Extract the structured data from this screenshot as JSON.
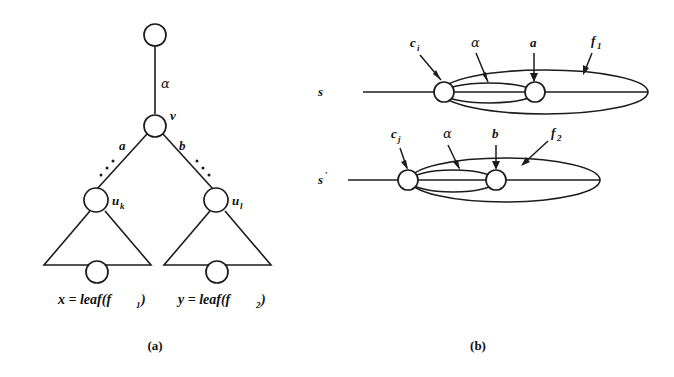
{
  "figure": {
    "background_color": "#ffffff",
    "ink_color": "#1c1c1c",
    "panels": [
      {
        "id": "panel-a",
        "caption": "(a)",
        "description": "tree diagram",
        "labels": {
          "alpha_edge": "α",
          "node_v": "v",
          "edge_a": "a",
          "edge_b": "b",
          "node_uk": "u",
          "node_uk_sub": "k",
          "node_ul": "u",
          "node_ul_sub": "l",
          "leaf_left": "x = leaf(f",
          "leaf_left_sub": "1",
          "leaf_left_end": ")",
          "leaf_right": "y = leaf(f",
          "leaf_right_sub": "2",
          "leaf_right_end": ")"
        }
      },
      {
        "id": "panel-b",
        "caption": "(b)",
        "description": "two sequence rows with nested ellipses",
        "rows": [
          {
            "id": "row-s",
            "row_label": "s",
            "row_label_sub": "",
            "annotations": [
              {
                "id": "ann-ci",
                "text": "c",
                "sub": "i"
              },
              {
                "id": "ann-alpha",
                "text": "α",
                "sub": ""
              },
              {
                "id": "ann-a",
                "text": "a",
                "sub": ""
              },
              {
                "id": "ann-f1",
                "text": "f",
                "sub": "1"
              }
            ]
          },
          {
            "id": "row-s-prime",
            "row_label": "s",
            "row_label_sub": "′",
            "annotations": [
              {
                "id": "ann-cj",
                "text": "c",
                "sub": "j"
              },
              {
                "id": "ann-alpha2",
                "text": "α",
                "sub": ""
              },
              {
                "id": "ann-b",
                "text": "b",
                "sub": ""
              },
              {
                "id": "ann-f2",
                "text": "f",
                "sub": "2"
              }
            ]
          }
        ]
      }
    ]
  }
}
